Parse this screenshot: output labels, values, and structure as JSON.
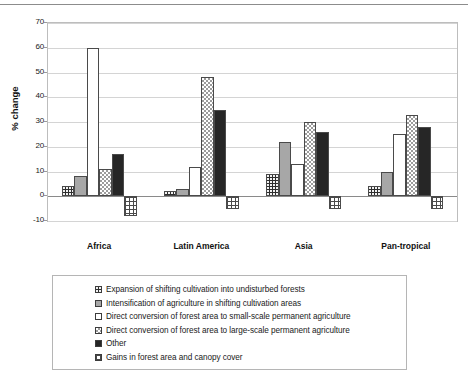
{
  "chart_data": {
    "type": "bar",
    "title": "",
    "subtitle": "",
    "xlabel": "",
    "ylabel": "% change",
    "ylim": [
      -10,
      70
    ],
    "yticks": [
      70,
      60,
      50,
      40,
      30,
      20,
      10,
      0,
      -10
    ],
    "ytick_labels": [
      "70",
      "60",
      "50",
      "40",
      "30",
      "20",
      "10",
      "0",
      "-10"
    ],
    "grid": true,
    "legend_position": "bottom",
    "categories": [
      "Africa",
      "Latin America",
      "Asia",
      "Pan-tropical"
    ],
    "series": [
      {
        "name": "Expansion of shifting cultivation into undisturbed forests",
        "pattern": "dark-dotted",
        "values": [
          4,
          2,
          9,
          4
        ]
      },
      {
        "name": "Intensification of agriculture in shifting cultivation areas",
        "pattern": "gray-solid",
        "values": [
          8,
          3,
          22,
          10
        ]
      },
      {
        "name": "Direct conversion of forest area to small-scale permanent agriculture",
        "pattern": "white-empty",
        "values": [
          60,
          12,
          13,
          25
        ]
      },
      {
        "name": "Direct conversion of forest area to large-scale permanent agriculture",
        "pattern": "light-checker",
        "values": [
          11,
          48,
          30,
          33
        ]
      },
      {
        "name": "Other",
        "pattern": "black-solid",
        "values": [
          17,
          35,
          26,
          28
        ]
      },
      {
        "name": "Gains in forest area and canopy cover",
        "pattern": "grid-lines",
        "values": [
          -8,
          -5,
          -5,
          -5
        ]
      }
    ]
  },
  "axis": {
    "ylabel": "% change"
  }
}
